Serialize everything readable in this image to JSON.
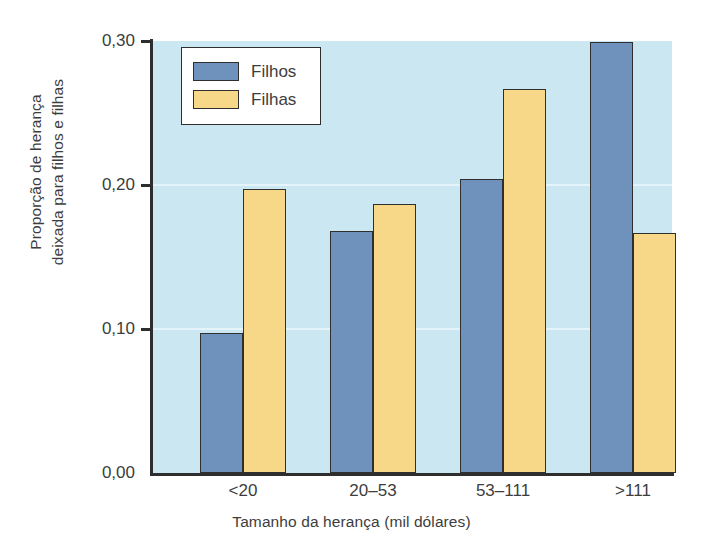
{
  "chart_data": {
    "type": "bar",
    "title": "",
    "subtitle": "",
    "xlabel": "Tamanho da herança (mil dólares)",
    "ylabel_line1": "Proporção de herança",
    "ylabel_line2": "deixada para filhos e filhas",
    "categories": [
      "<20",
      "20–53",
      "53–111",
      ">111"
    ],
    "series": [
      {
        "name": "Filhos",
        "color": "#6f92bd",
        "values": [
          0.097,
          0.168,
          0.204,
          0.299
        ]
      },
      {
        "name": "Filhas",
        "color": "#f7d788",
        "values": [
          0.197,
          0.187,
          0.267,
          0.167
        ]
      }
    ],
    "ylim": [
      0.0,
      0.3
    ],
    "yticks": [
      0.0,
      0.1,
      0.2,
      0.3
    ],
    "ytick_labels": [
      "0,00",
      "0,10",
      "0,20",
      "0,30"
    ],
    "grid": true,
    "grid_color": "#eaf6fb",
    "legend_position": "top-left",
    "plot_background": "#cbe7f2",
    "axis_color": "#2e2e2e",
    "bar_edge_color": "#2f2f2f"
  },
  "legend": {
    "items": [
      {
        "label": "Filhos",
        "color": "#6f92bd"
      },
      {
        "label": "Filhas",
        "color": "#f7d788"
      }
    ]
  }
}
